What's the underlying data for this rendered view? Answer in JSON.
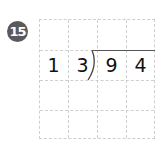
{
  "problem": {
    "number": "15",
    "divisor": [
      "1",
      "3"
    ],
    "dividend": [
      "9",
      "4"
    ],
    "grid": {
      "rows": 4,
      "cols": 4
    }
  },
  "colors": {
    "badge": "#5a5a5a",
    "grid_line": "#cfcfcf",
    "text": "#111111"
  }
}
